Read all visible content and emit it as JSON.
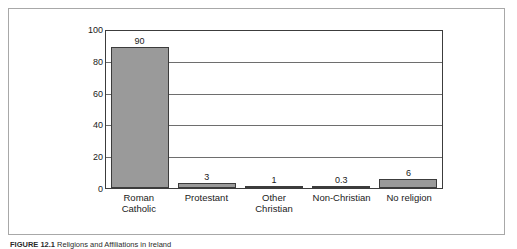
{
  "figure": {
    "caption_label": "FIGURE 12.1",
    "caption_text": "Religions and Affiliations in Ireland"
  },
  "chart_data": {
    "type": "bar",
    "title": "",
    "subtitle": "",
    "xlabel": "",
    "ylabel": "",
    "categories": [
      "Roman\nCatholic",
      "Protestant",
      "Other\nChristian",
      "Non-Christian",
      "No religion"
    ],
    "values": [
      90,
      3,
      1,
      0.3,
      6
    ],
    "value_labels": [
      "90",
      "3",
      "1",
      "0.3",
      "6"
    ],
    "ylim": [
      0,
      100
    ],
    "yticks": [
      100,
      80,
      60,
      40,
      20,
      0
    ],
    "ytick_labels": [
      "100",
      "80",
      "60",
      "40",
      "20",
      "0"
    ],
    "grid": true,
    "grid_axis": "y",
    "legend": false,
    "bar_color": "#9a9a9a",
    "bar_border_color": "#3c3c3c",
    "gridline_color": "#6e6e6e",
    "axis_color": "#3c3c3c",
    "frame_color": "#a8a8a8",
    "background": "#ffffff"
  }
}
